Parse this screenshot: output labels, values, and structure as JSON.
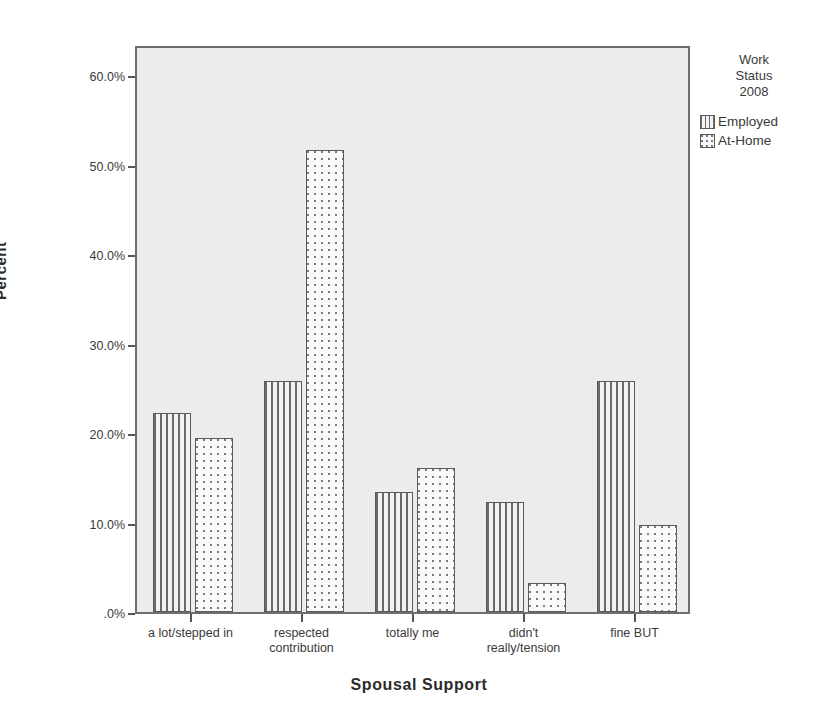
{
  "chart_data": {
    "type": "bar",
    "title": "",
    "xlabel": "Spousal Support",
    "ylabel": "Percent",
    "categories": [
      "a lot/stepped in",
      "respected\ncontribution",
      "totally me",
      "didn't\nreally/tension",
      "fine BUT"
    ],
    "series": [
      {
        "name": "Employed",
        "pattern": "vertical-stripes",
        "values": [
          22.2,
          25.8,
          13.4,
          12.3,
          25.8
        ]
      },
      {
        "name": "At-Home",
        "pattern": "dots",
        "values": [
          19.5,
          51.6,
          16.1,
          3.2,
          9.7
        ]
      }
    ],
    "ylim": [
      0,
      63.5
    ],
    "ytick_values": [
      0,
      10,
      20,
      30,
      40,
      50,
      60
    ],
    "ytick_labels": [
      ".0%",
      "10.0%",
      "20.0%",
      "30.0%",
      "40.0%",
      "50.0%",
      "60.0%"
    ],
    "grid": false,
    "legend_position": "right",
    "legend": {
      "title": "Work\nStatus\n2008",
      "entries": [
        "Employed",
        "At-Home"
      ]
    }
  },
  "axes": {
    "y_title": "Percent",
    "x_title": "Spousal Support"
  },
  "legend": {
    "title_lines": [
      "Work",
      "Status",
      "2008"
    ],
    "items": [
      {
        "label": "Employed",
        "pattern": "employed"
      },
      {
        "label": "At-Home",
        "pattern": "athome"
      }
    ]
  },
  "colors": {
    "plot_background": "#ececec",
    "frame": "#6e6e6e",
    "bar_outline": "#5a5a5a",
    "pattern_ink": "#6a6a6a",
    "text": "#3a3a3a",
    "page_background": "#ffffff"
  }
}
